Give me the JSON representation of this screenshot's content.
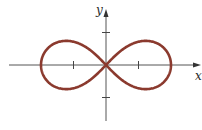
{
  "figure": {
    "axes": {
      "x_label": "x",
      "y_label": "y",
      "axis_color": "#555555"
    },
    "curve": {
      "name": "lemniscate",
      "color": "#8b3a2e",
      "parameter_a": 2
    },
    "ticks": {
      "x": [
        -1,
        1
      ],
      "y": [
        -1,
        1
      ]
    },
    "extent": {
      "x_intercepts": [
        -2,
        0,
        2
      ]
    }
  }
}
